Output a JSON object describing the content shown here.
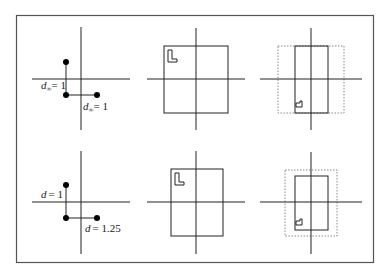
{
  "figure": {
    "frame": {
      "x": 16,
      "y": 15,
      "width": 357,
      "height": 247,
      "stroke": "#555555"
    },
    "colors": {
      "line": "#222222",
      "dotted": "#888888",
      "dot": "#000000",
      "background": "#ffffff"
    },
    "rows": [
      {
        "name": "top-row",
        "panel1": {
          "label_vertical": "d",
          "label_vertical_sub": "∞",
          "label_vertical_value": "= 1",
          "label_horizontal": "d",
          "label_horizontal_sub": "∞",
          "label_horizontal_value": "= 1"
        }
      },
      {
        "name": "bottom-row",
        "panel1": {
          "label_vertical": "d",
          "label_vertical_sub": "",
          "label_vertical_value": "= 1",
          "label_horizontal": "d",
          "label_horizontal_sub": "",
          "label_horizontal_value": "= 1.25"
        }
      }
    ],
    "icons": {
      "glyph_large": "L-shape-icon",
      "glyph_small": "rotated-L-shape-icon"
    }
  }
}
